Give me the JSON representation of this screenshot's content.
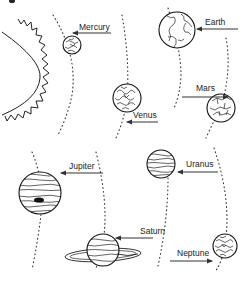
{
  "figure": {
    "panel_label": "a"
  },
  "sun": {
    "name": "Sun"
  },
  "planets": [
    {
      "name": "Mercury",
      "label": "Mercury"
    },
    {
      "name": "Venus",
      "label": "Venus"
    },
    {
      "name": "Earth",
      "label": "Earth"
    },
    {
      "name": "Mars",
      "label": "Mars"
    },
    {
      "name": "Jupiter",
      "label": "Jupiter"
    },
    {
      "name": "Saturn",
      "label": "Saturn"
    },
    {
      "name": "Uranus",
      "label": "Uranus"
    },
    {
      "name": "Neptune",
      "label": "Neptune"
    }
  ],
  "colors": {
    "line": "#111111",
    "background": "#ffffff"
  }
}
